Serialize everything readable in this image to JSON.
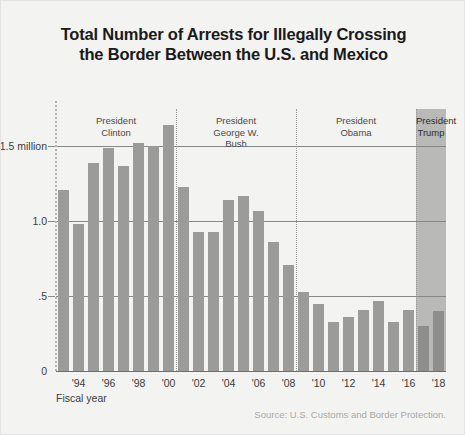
{
  "title": {
    "line1": "Total Number of Arrests for Illegally Crossing",
    "line2": "the Border Between the U.S. and Mexico"
  },
  "source": "Source: U.S. Customs and Border Protection.",
  "xaxis_title": "Fiscal year",
  "eras": [
    {
      "id": "clinton",
      "label_line1": "President",
      "label_line2": "Clinton",
      "label_line3": "",
      "start_year": 1993,
      "end_year": 2000,
      "shaded": false
    },
    {
      "id": "bush",
      "label_line1": "President",
      "label_line2": "George W.",
      "label_line3": "Bush",
      "start_year": 2001,
      "end_year": 2008,
      "shaded": false
    },
    {
      "id": "obama",
      "label_line1": "President",
      "label_line2": "Obama",
      "label_line3": "",
      "start_year": 2009,
      "end_year": 2016,
      "shaded": false
    },
    {
      "id": "trump",
      "label_line1": "President",
      "label_line2": "Trump",
      "label_line3": "",
      "start_year": 2017,
      "end_year": 2018,
      "shaded": true
    }
  ],
  "colors": {
    "background": "#f3f3f1",
    "bar": "#9b9b99",
    "bar_on_band": "#8e8e8c",
    "band": "#b9b9b7",
    "gridline": "#88888a",
    "title": "#1a1a1a",
    "source": "#a9a9a7"
  },
  "chart_data": {
    "type": "bar",
    "title": "Total Number of Arrests for Illegally Crossing the Border Between the U.S. and Mexico",
    "xlabel": "Fiscal year",
    "ylabel": "",
    "ylim": [
      0,
      1.75
    ],
    "grid": true,
    "legend": "none",
    "units": "millions of arrests",
    "ytick_labels": [
      "0",
      ".5",
      "1.0",
      "1.5 million"
    ],
    "ytick_values": [
      0,
      0.5,
      1.0,
      1.5
    ],
    "xtick_labels": [
      "'94",
      "'96",
      "'98",
      "'00",
      "'02",
      "'04",
      "'06",
      "'08",
      "'10",
      "'12",
      "'14",
      "'16",
      "'18"
    ],
    "xtick_years": [
      1994,
      1996,
      1998,
      2000,
      2002,
      2004,
      2006,
      2008,
      2010,
      2012,
      2014,
      2016,
      2018
    ],
    "categories": [
      1993,
      1994,
      1995,
      1996,
      1997,
      1998,
      1999,
      2000,
      2001,
      2002,
      2003,
      2004,
      2005,
      2006,
      2007,
      2008,
      2009,
      2010,
      2011,
      2012,
      2013,
      2014,
      2015,
      2016,
      2017,
      2018
    ],
    "values": [
      1.21,
      0.98,
      1.39,
      1.49,
      1.37,
      1.52,
      1.5,
      1.64,
      1.23,
      0.93,
      0.93,
      1.14,
      1.17,
      1.07,
      0.86,
      0.71,
      0.53,
      0.45,
      0.33,
      0.36,
      0.41,
      0.47,
      0.33,
      0.41,
      0.3,
      0.4
    ],
    "annotations": [
      "President Clinton",
      "President George W. Bush",
      "President Obama",
      "President Trump"
    ]
  }
}
